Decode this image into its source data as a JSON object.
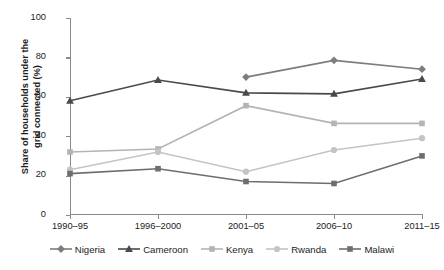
{
  "chart_data": {
    "type": "line",
    "title": "",
    "xlabel": "",
    "ylabel": "Share of households under the\ngrid connected (%)",
    "categories": [
      "1990–95",
      "1996–2000",
      "2001–05",
      "2006–10",
      "2011–15"
    ],
    "ylim": [
      0,
      100
    ],
    "yticks": [
      0,
      20,
      40,
      60,
      80,
      100
    ],
    "grid": false,
    "legend_position": "bottom",
    "series": [
      {
        "name": "Nigeria",
        "marker": "diamond",
        "color": "#7d7d7d",
        "values": [
          null,
          null,
          70,
          78.5,
          74
        ]
      },
      {
        "name": "Cameroon",
        "marker": "triangle",
        "color": "#4a4a4a",
        "values": [
          58,
          68.5,
          62,
          61.5,
          69
        ]
      },
      {
        "name": "Kenya",
        "marker": "square",
        "color": "#b4b4b4",
        "values": [
          32,
          33.5,
          55.5,
          46.5,
          46.5
        ]
      },
      {
        "name": "Rwanda",
        "marker": "circle",
        "color": "#c4c4c4",
        "values": [
          23,
          32,
          22,
          33,
          39
        ]
      },
      {
        "name": "Malawi",
        "marker": "square",
        "color": "#6e6e6e",
        "values": [
          21,
          23.5,
          17,
          16,
          30
        ]
      }
    ]
  }
}
